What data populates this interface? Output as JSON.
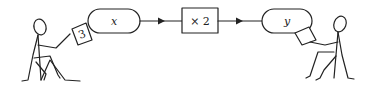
{
  "diagram": {
    "input_value": "3",
    "input_label": "x",
    "function_label": "× 2",
    "output_label": "y",
    "colors": {
      "stroke": "#222222",
      "background": "#ffffff"
    }
  }
}
